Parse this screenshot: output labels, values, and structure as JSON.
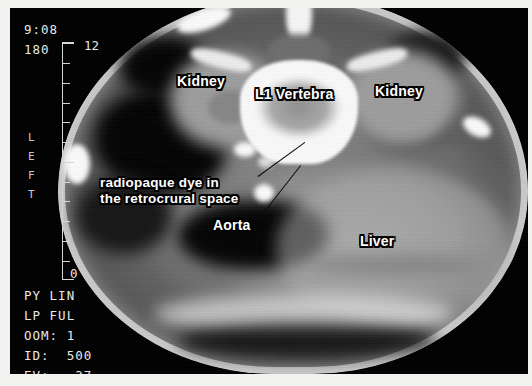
{
  "modality": "ct-abdomen-axial",
  "console": {
    "time": "9:08",
    "angle": "180",
    "orientation_marker": "LEFT",
    "rows": [
      {
        "name": "copy-mode",
        "text": "PY LIN"
      },
      {
        "name": "display-mode",
        "text": "LP FUL"
      },
      {
        "name": "zoom",
        "text": "OOM: 1"
      },
      {
        "name": "window-width",
        "text": "ID:  500"
      },
      {
        "name": "window-level",
        "text": "EV:   37"
      }
    ]
  },
  "scale": {
    "top_value": "12",
    "bottom_value": "0",
    "tick_count": 12
  },
  "annotations": [
    {
      "name": "kidney-left",
      "text": "Kidney",
      "x": 177,
      "y": 75,
      "size": 14
    },
    {
      "name": "l1-vertebra",
      "text": "L1 Vertebra",
      "x": 255,
      "y": 88,
      "size": 14
    },
    {
      "name": "kidney-right",
      "text": "Kidney",
      "x": 375,
      "y": 85,
      "size": 14
    },
    {
      "name": "retrocrural-dye",
      "text": "radiopaque dye in\nthe retrocrural space",
      "x": 100,
      "y": 177,
      "size": 13.5
    },
    {
      "name": "aorta",
      "text": "Aorta",
      "x": 213,
      "y": 219,
      "size": 14
    },
    {
      "name": "liver",
      "text": "Liver",
      "x": 360,
      "y": 235,
      "size": 14
    }
  ],
  "leaders": [
    {
      "name": "leader-dye",
      "x": 256,
      "y": 176,
      "length": 56,
      "angle": -36
    },
    {
      "name": "leader-aorta",
      "x": 258,
      "y": 217,
      "length": 64,
      "angle": -52
    }
  ],
  "colors": {
    "frame": "#000000",
    "page_background": "#f2f2f0",
    "label_text": "#ffffff",
    "label_outline": "#000000",
    "console_text": "#e8e8e8",
    "leader_line": "#0a0a0a"
  }
}
